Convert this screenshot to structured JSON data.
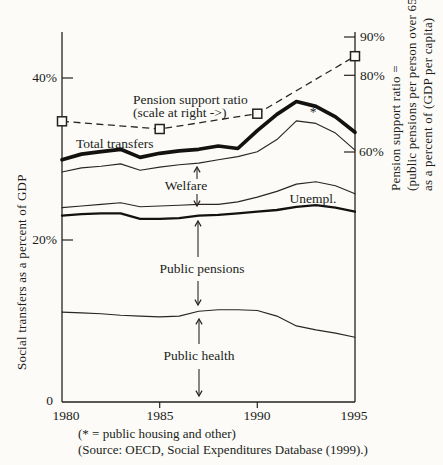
{
  "figure_title": "",
  "caption": {
    "housing_note": "(* = public housing and other)",
    "source_note": "(Source: OECD, Social Expenditures Database (1999).)"
  },
  "chart_data": {
    "type": "line",
    "title": "",
    "grid": false,
    "legend": "annotations inline, no legend box",
    "stacking_note": "Lines are cumulative upper boundaries of stacked bands, bottom to top: Public health, Public pensions, Unempl., Welfare, * (public housing and other); the top thick line is Total transfers.",
    "years": [
      1980,
      1981,
      1982,
      1983,
      1984,
      1985,
      1986,
      1987,
      1988,
      1989,
      1990,
      1991,
      1992,
      1993,
      1994,
      1995
    ],
    "x_ticks": [
      "1980",
      "1985",
      "1990",
      "1995"
    ],
    "left_axis": {
      "label": "Social transfers as a percent of GDP",
      "range": [
        0,
        46
      ],
      "ticks": [
        {
          "value": 40,
          "label": "40%"
        },
        {
          "value": 20,
          "label": "20%"
        },
        {
          "value": 0,
          "label": "0"
        }
      ]
    },
    "right_axis": {
      "label": "Pension support ratio = (public pensions per person over 65) as a percent of (GDP per capita)",
      "label_lines": [
        "Pension support ratio =",
        "(public pensions per person over 65)",
        "as a percent of (GDP per capita)"
      ],
      "range": [
        50,
        91
      ],
      "ticks": [
        {
          "value": 90,
          "label": "90%"
        },
        {
          "value": 80,
          "label": "80%"
        },
        {
          "value": 60,
          "label": "60%"
        }
      ]
    },
    "series": [
      {
        "name": "Total transfers",
        "axis": "left",
        "line": "thick",
        "values": [
          29.9,
          30.6,
          30.9,
          31.2,
          30.2,
          30.7,
          31.0,
          31.2,
          31.6,
          31.3,
          33.5,
          35.5,
          37.1,
          36.5,
          35.2,
          33.3
        ]
      },
      {
        "name": "Welfare (upper boundary)",
        "axis": "left",
        "line": "thin",
        "values": [
          28.4,
          28.9,
          29.1,
          29.4,
          28.6,
          29.0,
          29.3,
          29.5,
          29.9,
          30.3,
          30.9,
          32.4,
          34.7,
          34.4,
          33.2,
          31.1
        ]
      },
      {
        "name": "Unempl. (upper boundary)",
        "axis": "left",
        "line": "thin",
        "values": [
          24.0,
          24.2,
          24.4,
          24.6,
          24.1,
          24.2,
          24.3,
          24.4,
          24.4,
          24.7,
          25.3,
          26.0,
          26.9,
          27.2,
          26.7,
          25.7
        ]
      },
      {
        "name": "Public pensions (upper boundary)",
        "axis": "left",
        "line": "medium",
        "values": [
          23.0,
          23.2,
          23.3,
          23.3,
          22.6,
          22.6,
          22.7,
          23.0,
          23.1,
          23.3,
          23.5,
          23.7,
          24.1,
          24.3,
          24.0,
          23.5
        ]
      },
      {
        "name": "Public health (upper boundary)",
        "axis": "left",
        "line": "thin",
        "values": [
          11.1,
          11.0,
          10.9,
          10.7,
          10.6,
          10.5,
          10.6,
          11.2,
          11.4,
          11.4,
          11.3,
          10.6,
          9.4,
          8.9,
          8.5,
          8.0
        ]
      },
      {
        "name": "Pension support ratio",
        "axis": "right",
        "line": "dashed",
        "marker": "square",
        "x": [
          1980,
          1985,
          1990,
          1995
        ],
        "values": [
          68,
          66,
          70,
          85
        ]
      }
    ],
    "annotations": {
      "total_transfers": "Total transfers",
      "pension_ratio": [
        "Pension support ratio",
        "(scale at right ->)"
      ],
      "welfare": "Welfare",
      "unempl": "Unempl.",
      "public_pensions": "Public pensions",
      "public_health": "Public health",
      "asterisk": "*"
    }
  }
}
